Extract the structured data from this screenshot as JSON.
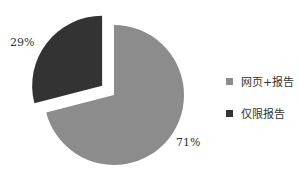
{
  "chart_data": {
    "type": "pie",
    "title": "",
    "categories": [
      "网页+报告",
      "仅限报告"
    ],
    "values": [
      71,
      29
    ],
    "labels": [
      "71%",
      "29%"
    ],
    "colors": [
      "#8c8c8c",
      "#333333"
    ],
    "exploded": [
      false,
      true
    ],
    "legend_position": "right"
  },
  "legend": [
    {
      "label": "网页+报告",
      "color": "#8c8c8c"
    },
    {
      "label": "仅限报告",
      "color": "#333333"
    }
  ]
}
